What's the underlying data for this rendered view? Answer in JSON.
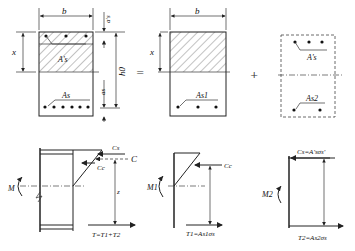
{
  "figure": {
    "operators": {
      "equals": "=",
      "plus": "+"
    },
    "top_row": {
      "full_section": {
        "width_label": "b",
        "compression_depth_label": "x",
        "top_cover_label": "a's",
        "effective_depth_label": "h0",
        "bottom_cover_label": "as",
        "compression_steel_label": "A's",
        "tension_steel_label": "As",
        "top_bars": 3,
        "bottom_bars": 6
      },
      "concrete_part": {
        "width_label": "b",
        "compression_depth_label": "x",
        "tension_steel_label": "As1",
        "bottom_bars": 3
      },
      "steel_part": {
        "compression_steel_label": "A's",
        "tension_steel_label": "As2",
        "top_bars": 3,
        "bottom_bars": 2
      }
    },
    "bottom_row": {
      "full_forces": {
        "moment_label": "M",
        "steel_compression_label": "Cs",
        "total_compression_label": "C",
        "concrete_compression_label": "Cc",
        "lever_arm_label": "z",
        "tension_label": "T=T1+T2"
      },
      "concrete_forces": {
        "moment_label": "M1",
        "compression_label": "Cc",
        "tension_label": "T1=As1σs"
      },
      "steel_forces": {
        "moment_label": "M2",
        "compression_label": "Cs=A'sσs'",
        "tension_label": "T2=As2σs"
      }
    }
  }
}
